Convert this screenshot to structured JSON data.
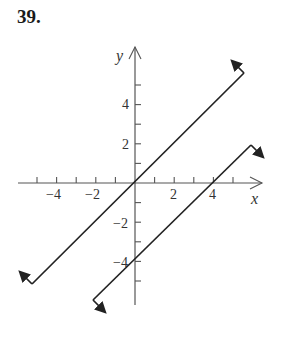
{
  "problem": {
    "number": "39."
  },
  "chart_data": {
    "type": "line",
    "title": "",
    "xlabel": "x",
    "ylabel": "y",
    "xlim": [
      -5.5,
      6.5
    ],
    "ylim": [
      -6.2,
      6.8
    ],
    "grid": false,
    "x_ticks": [
      -5,
      -4,
      -3,
      -2,
      -1,
      1,
      2,
      3,
      4,
      5
    ],
    "y_ticks": [
      -5,
      -4,
      -3,
      -2,
      -1,
      1,
      2,
      3,
      4,
      5
    ],
    "x_tick_labels": [
      {
        "value": -4,
        "label": "−4"
      },
      {
        "value": -2,
        "label": "−2"
      },
      {
        "value": 2,
        "label": "2"
      },
      {
        "value": 4,
        "label": "4"
      }
    ],
    "y_tick_labels": [
      {
        "value": 4,
        "label": "4"
      },
      {
        "value": 2,
        "label": "2"
      },
      {
        "value": -2,
        "label": "−2"
      },
      {
        "value": -4,
        "label": "−4"
      }
    ],
    "series": [
      {
        "name": "y = x",
        "equation": "y = x",
        "x": [
          -5.25,
          5.56
        ],
        "y": [
          -5.15,
          5.6
        ],
        "end_hooks": "up-left arrows at both ends"
      },
      {
        "name": "y = x - 4",
        "equation": "y = x - 4",
        "x": [
          -2.14,
          5.92
        ],
        "y": [
          -5.97,
          1.94
        ],
        "end_hooks": "down-right arrows at both ends"
      }
    ],
    "color": "#222222"
  }
}
